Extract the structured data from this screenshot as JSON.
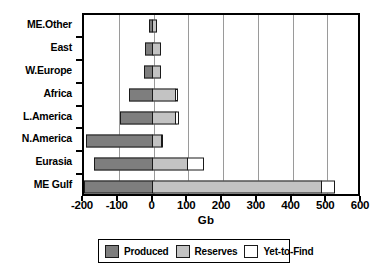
{
  "chart_data": {
    "type": "bar",
    "orientation": "horizontal",
    "stacked": true,
    "title": "",
    "xlabel": "Gb",
    "ylabel": "",
    "xlim": [
      -200,
      600
    ],
    "xticks": [
      -200,
      -100,
      0,
      100,
      200,
      300,
      400,
      500,
      600
    ],
    "xtick_labels": [
      "-200",
      "-100",
      "0",
      "100",
      "200",
      "300",
      "400",
      "500",
      "600"
    ],
    "grid": true,
    "grid_axis": "x",
    "legend_position": "bottom",
    "categories": [
      "ME.Other",
      "East",
      "W.Europe",
      "Africa",
      "L.America",
      "N.America",
      "Eurasia",
      "ME Gulf"
    ],
    "series": [
      {
        "name": "Produced",
        "color": "#7e7e7e",
        "values": [
          -13,
          -25,
          -28,
          -70,
          -95,
          -193,
          -170,
          -200
        ]
      },
      {
        "name": "Reserves",
        "color": "#c3c3c3",
        "values": [
          13,
          25,
          25,
          68,
          70,
          28,
          105,
          490
        ]
      },
      {
        "name": "Yet-to-Find",
        "color": "#ffffff",
        "values": [
          0,
          0,
          0,
          10,
          10,
          5,
          48,
          40
        ]
      }
    ]
  },
  "axis": {
    "x_title": "Gb",
    "tick_labels": [
      "-200",
      "-100",
      "0",
      "100",
      "200",
      "300",
      "400",
      "500",
      "600"
    ],
    "category_labels": [
      "ME.Other",
      "East",
      "W.Europe",
      "Africa",
      "L.America",
      "N.America",
      "Eurasia",
      "ME Gulf"
    ]
  },
  "legend": {
    "items": [
      {
        "label": "Produced",
        "color": "#7e7e7e"
      },
      {
        "label": "Reserves",
        "color": "#c3c3c3"
      },
      {
        "label": "Yet-to-Find",
        "color": "#ffffff"
      }
    ]
  },
  "colors": {
    "produced": "#7e7e7e",
    "reserves": "#c3c3c3",
    "yet_to_find": "#ffffff",
    "axis": "#000000",
    "grid": "#9a9a9a",
    "background": "#ffffff"
  }
}
